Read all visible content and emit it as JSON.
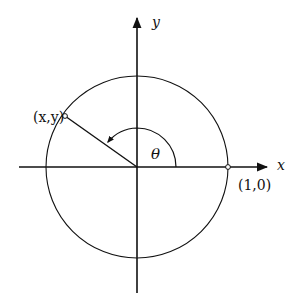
{
  "diagram": {
    "type": "unit-circle",
    "axes": {
      "x_label": "x",
      "y_label": "y"
    },
    "points": {
      "terminal_label": "(x,y)",
      "initial_label": "(1,0)"
    },
    "angle_label": "θ",
    "angle_degrees": 148,
    "colors": {
      "stroke": "#111111",
      "background": "#ffffff"
    }
  }
}
